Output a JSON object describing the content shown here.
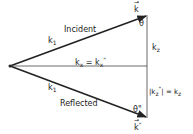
{
  "diagram": {
    "labels": {
      "incident": "Incident",
      "reflected": "Reflected",
      "k1_top": "k",
      "k1_top_sub": "1",
      "k1_bottom": "k",
      "k1_bottom_sub": "1",
      "k_vec": "k",
      "k_vec_arrow": "→",
      "k_ref_vec": "k",
      "k_ref_sup": "\"",
      "k_ref_arrow": "→",
      "theta": "θ",
      "theta_ref": "θ\"",
      "kz": "k",
      "kz_sub": "z",
      "kx_eq_left": "k",
      "kx_eq_left_sub": "x",
      "kx_eq_mid": " = k",
      "kx_eq_right_sub": "x",
      "kx_eq_right_sup": "\"",
      "kz_ref_abs_open": "|k",
      "kz_ref_sub": "z",
      "kz_ref_sup": "\"",
      "kz_ref_abs_close": "| = k",
      "kz_ref_rhs_sub": "z"
    },
    "colors": {
      "line": "#222222",
      "text": "#222222"
    }
  }
}
